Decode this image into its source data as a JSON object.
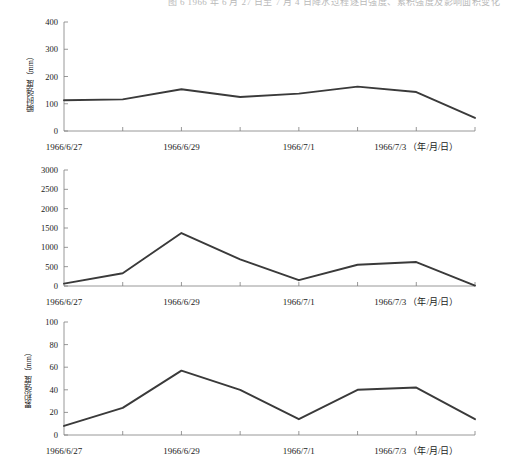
{
  "figure": {
    "caption_top": "图 6 1966 年 6 月 27 日至 7 月 4 日降水过程逐日强度、累积强度及影响面积变化",
    "line_color": "#3a3a3a",
    "axis_color": "#7d7d7d",
    "background": "#ffffff"
  },
  "x_axis": {
    "label_suffix": "（年/月/日）",
    "tick_labels": [
      "1966/6/27",
      "1966/6/29",
      "1966/7/1",
      "1966/7/3"
    ],
    "tick_label_last_full": "1966/7/3 （年/月/日）",
    "dates": [
      "1966/6/27",
      "1966/6/28",
      "1966/6/29",
      "1966/6/30",
      "1966/7/1",
      "1966/7/2",
      "1966/7/3",
      "1966/7/4"
    ]
  },
  "chart_data": [
    {
      "type": "line",
      "title": "",
      "xlabel": "（年/月/日）",
      "ylabel": "瞬时强度（mm）",
      "categories": [
        "1966/6/27",
        "1966/6/28",
        "1966/6/29",
        "1966/6/30",
        "1966/7/1",
        "1966/7/2",
        "1966/7/3",
        "1966/7/4"
      ],
      "values": [
        113,
        116,
        153,
        125,
        137,
        163,
        143,
        48
      ],
      "ylim": [
        0,
        400
      ],
      "yticks": [
        0,
        100,
        200,
        300,
        400
      ],
      "ytick_labels": [
        "0",
        "100",
        "200",
        "300",
        "400"
      ],
      "grid": false,
      "legend": "none"
    },
    {
      "type": "line",
      "title": "",
      "xlabel": "（年/月/日）",
      "ylabel": "累积强度（mm）",
      "categories": [
        "1966/6/27",
        "1966/6/28",
        "1966/6/29",
        "1966/6/30",
        "1966/7/1",
        "1966/7/2",
        "1966/7/3",
        "1966/7/4"
      ],
      "values": [
        60,
        330,
        1370,
        690,
        150,
        550,
        620,
        10
      ],
      "ylim": [
        0,
        3000
      ],
      "yticks": [
        0,
        500,
        1000,
        1500,
        2000,
        2500,
        3000
      ],
      "ytick_labels": [
        "0",
        "500",
        "1000",
        "1500",
        "2000",
        "2500",
        "3000"
      ],
      "grid": false,
      "legend": "none"
    },
    {
      "type": "line",
      "title": "",
      "xlabel": "（年/月/日）",
      "ylabel": "影响面积（万km²）",
      "categories": [
        "1966/6/27",
        "1966/6/28",
        "1966/6/29",
        "1966/6/30",
        "1966/7/1",
        "1966/7/2",
        "1966/7/3",
        "1966/7/4"
      ],
      "values": [
        8,
        24,
        57,
        40,
        14,
        40,
        42,
        14
      ],
      "ylim": [
        0,
        100
      ],
      "yticks": [
        0,
        20,
        40,
        60,
        80,
        100
      ],
      "ytick_labels": [
        "0",
        "20",
        "40",
        "60",
        "80",
        "100"
      ],
      "grid": false,
      "legend": "none"
    }
  ]
}
